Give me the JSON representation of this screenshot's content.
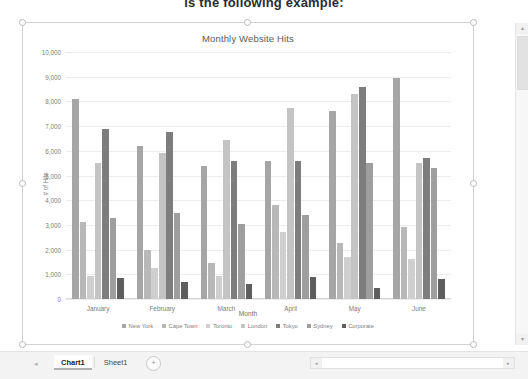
{
  "document": {
    "cut_off_heading": "is the following example:"
  },
  "workbook": {
    "tabs": [
      {
        "label": "Chart1",
        "active": true
      },
      {
        "label": "Sheet1",
        "active": false
      }
    ],
    "add_sheet_label": "+",
    "nav_prev": "◂",
    "nav_next": "▸",
    "hscroll_left": "◂",
    "hscroll_right": "▸",
    "vscroll_up": "▴",
    "vscroll_down": "▾"
  },
  "chart_data": {
    "type": "bar",
    "title": "Monthly Website Hits",
    "xlabel": "Month",
    "ylabel": "# of Hits",
    "ylim": [
      0,
      10000
    ],
    "ytick_step": 1000,
    "ytick_labels": [
      "10,000",
      "9,000",
      "8,000",
      "7,000",
      "6,000",
      "5,000",
      "4,000",
      "3,000",
      "2,000",
      "1,000",
      "0"
    ],
    "grid": true,
    "legend_position": "bottom",
    "categories": [
      "January",
      "February",
      "March",
      "April",
      "May",
      "June"
    ],
    "series": [
      {
        "name": "New York",
        "color": "#a6a6a6",
        "values": [
          8100,
          6200,
          5400,
          5600,
          7600,
          8950
        ]
      },
      {
        "name": "Cape Town",
        "color": "#b8b8b8",
        "values": [
          3100,
          2000,
          1450,
          3800,
          2250,
          2900
        ]
      },
      {
        "name": "Toronto",
        "color": "#cfcfcf",
        "values": [
          950,
          1250,
          950,
          2700,
          1700,
          1600
        ]
      },
      {
        "name": "London",
        "color": "#c4c4c4",
        "values": [
          5500,
          5900,
          6450,
          7750,
          8300,
          5500
        ]
      },
      {
        "name": "Tokyo",
        "color": "#7d7d7d",
        "values": [
          6900,
          6750,
          5600,
          5600,
          8600,
          5700
        ]
      },
      {
        "name": "Sydney",
        "color": "#9e9e9e",
        "values": [
          3300,
          3500,
          3050,
          3400,
          5500,
          5300
        ]
      },
      {
        "name": "Corporate",
        "color": "#5e5e5e",
        "values": [
          850,
          700,
          600,
          900,
          450,
          800
        ]
      }
    ]
  }
}
